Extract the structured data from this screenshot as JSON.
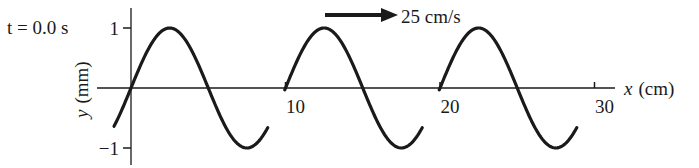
{
  "chart_data": {
    "type": "line",
    "title": "",
    "annotation_time": "t = 0.0 s",
    "velocity_label": "25 cm/s",
    "velocity_direction": "right",
    "xlabel_var": "x",
    "xlabel_unit": "(cm)",
    "ylabel_var": "y",
    "ylabel_unit": "(mm)",
    "x_ticks": [
      {
        "value": 10,
        "label": "10"
      },
      {
        "value": 20,
        "label": "20"
      },
      {
        "value": 30,
        "label": "30"
      }
    ],
    "y_ticks": [
      {
        "value": 1,
        "label": "1"
      },
      {
        "value": -1,
        "label": "−1"
      }
    ],
    "xlim": [
      -2,
      34
    ],
    "ylim": [
      -1.3,
      1.35
    ],
    "grid": false,
    "series": [
      {
        "name": "wave",
        "function": "y = A sin(2πx/λ)",
        "amplitude_mm": 1,
        "wavelength_cm": 10,
        "x_start": -1.1,
        "x_end": 29.2,
        "gaps_around_x": [
          10,
          20,
          30
        ]
      }
    ]
  }
}
